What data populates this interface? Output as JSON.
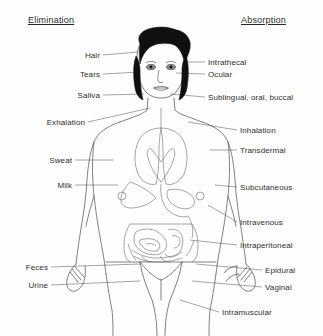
{
  "diagram": {
    "title_left": "Elimination",
    "title_right": "Absorption",
    "background_color": "#fefefe",
    "line_color": "#4a4a4a",
    "hair_color": "#101010"
  },
  "elimination_routes": [
    {
      "label": "Hair",
      "label_x": 100,
      "label_y": 55,
      "anchor_x": 138,
      "anchor_y": 52
    },
    {
      "label": "Tears",
      "label_x": 100,
      "label_y": 74,
      "anchor_x": 140,
      "anchor_y": 72
    },
    {
      "label": "Saliva",
      "label_x": 100,
      "label_y": 95,
      "anchor_x": 144,
      "anchor_y": 94
    },
    {
      "label": "Exhalation",
      "label_x": 85,
      "label_y": 122,
      "anchor_x": 150,
      "anchor_y": 108
    },
    {
      "label": "Sweat",
      "label_x": 72,
      "label_y": 160,
      "anchor_x": 114,
      "anchor_y": 160
    },
    {
      "label": "Milk",
      "label_x": 72,
      "label_y": 185,
      "anchor_x": 118,
      "anchor_y": 185
    },
    {
      "label": "Feces",
      "label_x": 48,
      "label_y": 267,
      "anchor_x": 140,
      "anchor_y": 264
    },
    {
      "label": "Urine",
      "label_x": 48,
      "label_y": 285,
      "anchor_x": 140,
      "anchor_y": 281
    }
  ],
  "absorption_routes": [
    {
      "label": "Intrathecal",
      "label_x": 208,
      "label_y": 62,
      "anchor_x": 185,
      "anchor_y": 62
    },
    {
      "label": "Ocular",
      "label_x": 208,
      "label_y": 74,
      "anchor_x": 176,
      "anchor_y": 73
    },
    {
      "label": "Sublingual, oral, buccal",
      "label_x": 208,
      "label_y": 97,
      "anchor_x": 170,
      "anchor_y": 94
    },
    {
      "label": "Inhalation",
      "label_x": 240,
      "label_y": 130,
      "anchor_x": 188,
      "anchor_y": 122
    },
    {
      "label": "Transdermal",
      "label_x": 240,
      "label_y": 150,
      "anchor_x": 210,
      "anchor_y": 150
    },
    {
      "label": "Subcutaneous",
      "label_x": 240,
      "label_y": 187,
      "anchor_x": 215,
      "anchor_y": 185
    },
    {
      "label": "Intravenous",
      "label_x": 240,
      "label_y": 222,
      "anchor_x": 208,
      "anchor_y": 205
    },
    {
      "label": "Intraperitoneal",
      "label_x": 240,
      "label_y": 245,
      "anchor_x": 190,
      "anchor_y": 240
    },
    {
      "label": "Epidural",
      "label_x": 265,
      "label_y": 270,
      "anchor_x": 196,
      "anchor_y": 264
    },
    {
      "label": "Vaginal",
      "label_x": 265,
      "label_y": 287,
      "anchor_x": 192,
      "anchor_y": 281
    },
    {
      "label": "Intramuscular",
      "label_x": 222,
      "label_y": 312,
      "anchor_x": 180,
      "anchor_y": 300
    }
  ]
}
